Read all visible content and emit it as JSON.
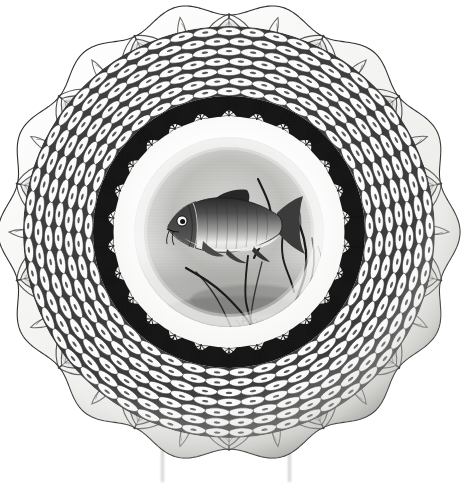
{
  "image": {
    "kind": "photograph",
    "subject": "antique transfer-printed ceramic plate",
    "background_color": "#ffffff",
    "width": 464,
    "height": 487,
    "alt_text": "Black and white transfer-printed ceramic plate with a fish painted in the center, a scalloped fern-sprig border and a dense scale-lattice rim with embossed scrollwork, displayed on a clear plate stand."
  },
  "plate": {
    "name": "decorative-plate",
    "center_x": 229,
    "center_y": 232,
    "outer_radius_x": 224,
    "outer_radius_y": 223,
    "edge_color": "#2b2b2b",
    "body_color": "#f2f2f0",
    "highlight_color": "#ffffff"
  },
  "rim": {
    "label": "scale-diaper-lattice-rim",
    "outer_radius": 206,
    "inner_radius": 136,
    "cell_count_around": 54,
    "cell_rings": 7,
    "ink_color": "#1e1e1e",
    "cell_fill": "#fbfbfb",
    "description": "dense trellis of small scale-shaped cells, each with a dark outline and a pale center dot"
  },
  "scroll_edge": {
    "label": "embossed-acanthus-scroll-edge",
    "lobe_count": 14,
    "ink_color": "#3a3a3a",
    "description": "moulded relief acanthus leaves and C-scrolls around the outer rim, scalloped in 14 lobes"
  },
  "sprig_band": {
    "label": "scalloped-fern-sprig-band",
    "outer_radius": 136,
    "inner_radius": 116,
    "scallop_count": 26,
    "band_color": "#171717",
    "sprig_color": "#141414",
    "description": "solid dark ring with scalloped inner edge; a small fern sprig radiates inward from each scallop"
  },
  "cavetto": {
    "label": "plain-white-well",
    "radius": 116,
    "color": "#fdfdfd"
  },
  "center_scene": {
    "label": "fish-vignette",
    "radius": 95,
    "wash_color": "#a9a9a7",
    "title": "Fish among water weeds",
    "subject": "fish",
    "species_hint": "barbel / carp",
    "elements": [
      "fish with barbels",
      "dorsal fin",
      "forked caudal fin",
      "pectoral and pelvic fins",
      "reed and water-weed stems",
      "river bed wash",
      "water surface wash"
    ],
    "signature_text": "J. Birbeck",
    "signature_legible": false
  },
  "stand": {
    "label": "clear-plate-stand",
    "legs": 2,
    "left_leg_x": 163,
    "right_leg_x": 290,
    "top_y": 443,
    "bottom_y": 482,
    "color": "#dcdcdc"
  },
  "palette": {
    "ink": "#111111",
    "mid_gray": "#7d7d7d",
    "light_gray": "#c9c9c9",
    "paper": "#ffffff"
  }
}
